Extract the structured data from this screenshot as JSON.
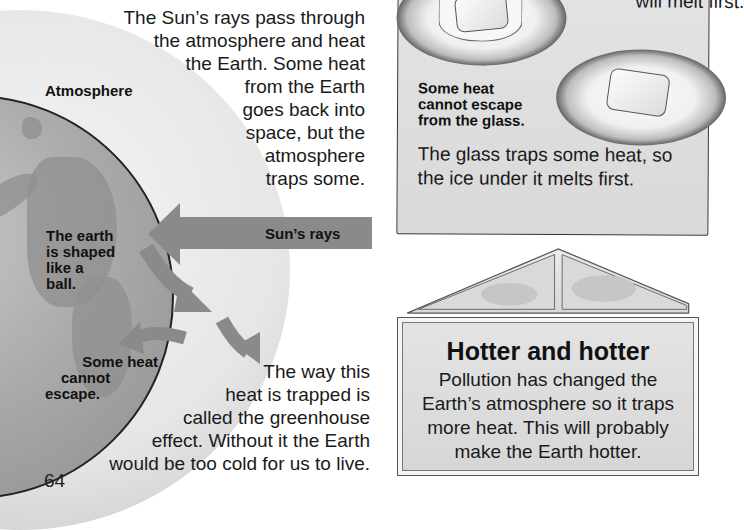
{
  "page": {
    "number": "64"
  },
  "earth_diagram": {
    "intro_text": [
      "The Sun’s rays pass through",
      "the atmosphere and heat",
      "the Earth. Some heat",
      "from the Earth",
      "goes back into",
      "space, but the",
      "atmosphere",
      "traps some."
    ],
    "labels": {
      "atmosphere": "Atmosphere",
      "earth_shape": [
        "The earth",
        "is shaped",
        "like a",
        "ball."
      ],
      "sun_rays": "Sun’s rays",
      "heat_trapped": [
        "Some heat",
        "cannot",
        "escape."
      ]
    },
    "outro_text": [
      "The way this",
      "heat is trapped is",
      "called the greenhouse",
      "effect. Without it the Earth",
      "would be too cold for us to live."
    ]
  },
  "ice_experiment": {
    "top_caption_partial": "will melt first.",
    "glass_label": [
      "Some heat",
      "cannot escape",
      "from the glass."
    ],
    "explanation": [
      "The glass traps some heat, so",
      "the ice under it melts first."
    ]
  },
  "greenhouse_box": {
    "title": "Hotter and hotter",
    "text": [
      "Pollution has changed the",
      "Earth’s atmosphere so it traps",
      "more heat. This will probably",
      "make the Earth hotter."
    ]
  },
  "colors": {
    "arrow_gray": "#8a8a8a",
    "panel_gray": "#dedede",
    "text": "#1a1a1a"
  }
}
